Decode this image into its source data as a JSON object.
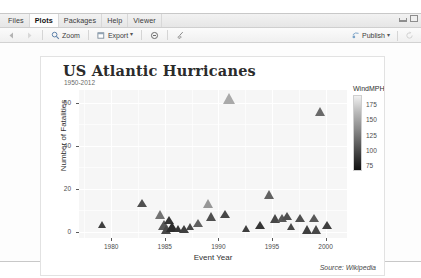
{
  "window": {
    "tabs": [
      {
        "label": "Files",
        "active": false
      },
      {
        "label": "Plots",
        "active": true
      },
      {
        "label": "Packages",
        "active": false
      },
      {
        "label": "Help",
        "active": false
      },
      {
        "label": "Viewer",
        "active": false
      }
    ],
    "minimize_icon": "minimize-icon",
    "maximize_icon": "maximize-icon"
  },
  "toolbar": {
    "back_icon": "back-arrow-icon",
    "forward_icon": "forward-arrow-icon",
    "zoom_label": "Zoom",
    "zoom_icon": "magnifier-icon",
    "export_label": "Export",
    "export_icon": "export-icon",
    "export_caret": "▾",
    "remove_icon": "remove-plot-icon",
    "clear_icon": "broom-clear-icon",
    "publish_label": "Publish",
    "publish_icon": "publish-icon",
    "publish_caret": "▾",
    "refresh_icon": "refresh-icon"
  },
  "chart_data": {
    "type": "scatter",
    "title": "US Atlantic Hurricanes",
    "subtitle": "1950-2012",
    "caption": "Source: Wikipedia",
    "xlabel": "Event Year",
    "ylabel": "Number of Fatalities",
    "xlim": [
      1977,
      2002
    ],
    "ylim": [
      -3,
      66
    ],
    "xticks": [
      1980,
      1985,
      1990,
      1995,
      2000
    ],
    "yticks": [
      0,
      20,
      40,
      60
    ],
    "grid": true,
    "marker": "triangle",
    "legend": {
      "title": "WindMPH",
      "position": "right",
      "ticks": [
        175,
        150,
        125,
        100,
        75
      ],
      "vmin": 65,
      "vmax": 190,
      "colormap_low": "#111111",
      "colormap_high": "#f0f0f0"
    },
    "points": [
      {
        "x": 1979.2,
        "y": 3,
        "wind": 90,
        "size": 9
      },
      {
        "x": 1982.9,
        "y": 13,
        "wind": 100,
        "size": 10
      },
      {
        "x": 1984.6,
        "y": 8,
        "wind": 120,
        "size": 11
      },
      {
        "x": 1984.9,
        "y": 3,
        "wind": 105,
        "size": 12
      },
      {
        "x": 1985.2,
        "y": 1,
        "wind": 95,
        "size": 11
      },
      {
        "x": 1985.4,
        "y": 5,
        "wind": 85,
        "size": 10
      },
      {
        "x": 1985.7,
        "y": 2,
        "wind": 80,
        "size": 12
      },
      {
        "x": 1986.3,
        "y": 1,
        "wind": 85,
        "size": 9
      },
      {
        "x": 1986.8,
        "y": 1,
        "wind": 90,
        "size": 10
      },
      {
        "x": 1987.4,
        "y": 2,
        "wind": 95,
        "size": 9
      },
      {
        "x": 1988.1,
        "y": 4,
        "wind": 110,
        "size": 10
      },
      {
        "x": 1989.1,
        "y": 13,
        "wind": 140,
        "size": 11
      },
      {
        "x": 1989.4,
        "y": 7,
        "wind": 100,
        "size": 11
      },
      {
        "x": 1990.6,
        "y": 8,
        "wind": 95,
        "size": 10
      },
      {
        "x": 1991.0,
        "y": 62,
        "wind": 150,
        "size": 13
      },
      {
        "x": 1992.6,
        "y": 1,
        "wind": 90,
        "size": 9
      },
      {
        "x": 1993.9,
        "y": 3,
        "wind": 85,
        "size": 10
      },
      {
        "x": 1994.8,
        "y": 17,
        "wind": 110,
        "size": 11
      },
      {
        "x": 1995.3,
        "y": 6,
        "wind": 95,
        "size": 11
      },
      {
        "x": 1995.9,
        "y": 6,
        "wind": 105,
        "size": 10
      },
      {
        "x": 1996.4,
        "y": 7,
        "wind": 100,
        "size": 10
      },
      {
        "x": 1996.8,
        "y": 2,
        "wind": 95,
        "size": 9
      },
      {
        "x": 1997.6,
        "y": 6,
        "wind": 100,
        "size": 10
      },
      {
        "x": 1998.3,
        "y": 1,
        "wind": 90,
        "size": 11
      },
      {
        "x": 1998.9,
        "y": 6,
        "wind": 105,
        "size": 10
      },
      {
        "x": 1999.2,
        "y": 1,
        "wind": 95,
        "size": 11
      },
      {
        "x": 1999.5,
        "y": 56,
        "wind": 115,
        "size": 11
      },
      {
        "x": 2000.1,
        "y": 3,
        "wind": 90,
        "size": 10
      }
    ]
  }
}
